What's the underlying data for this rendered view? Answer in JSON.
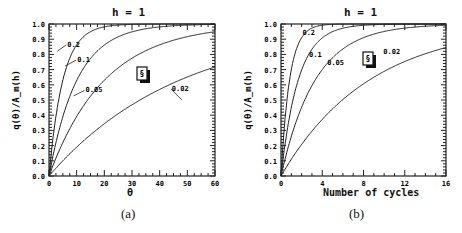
{
  "chart_data": [
    {
      "type": "line",
      "panel": "(a)",
      "title": "h = 1",
      "xlabel": "θ",
      "ylabel": "q(θ)/A_m(h)",
      "xlim": [
        0,
        60
      ],
      "ylim": [
        0.0,
        1.0
      ],
      "xticks": [
        "0",
        "10",
        "20",
        "30",
        "40",
        "50",
        "60"
      ],
      "yticks": [
        "0.0",
        "0.1",
        "0.2",
        "0.3",
        "0.4",
        "0.5",
        "0.6",
        "0.7",
        "0.8",
        "0.9",
        "1.0"
      ],
      "grid": false,
      "legend_icon": "stacked-page-icon",
      "x": [
        0,
        5,
        10,
        20,
        30,
        40,
        60
      ],
      "series": [
        {
          "name": "0.2",
          "values": [
            0,
            0.63,
            0.86,
            0.98,
            1.0,
            1.0,
            1.0
          ]
        },
        {
          "name": "0.1",
          "values": [
            0,
            0.39,
            0.63,
            0.86,
            0.95,
            0.98,
            1.0
          ]
        },
        {
          "name": "0.05",
          "values": [
            0,
            0.22,
            0.39,
            0.63,
            0.78,
            0.86,
            0.95
          ]
        },
        {
          "name": "0.02",
          "values": [
            0,
            0.1,
            0.18,
            0.33,
            0.45,
            0.55,
            0.7
          ]
        }
      ]
    },
    {
      "type": "line",
      "panel": "(b)",
      "title": "h = 1",
      "xlabel": "Number of cycles",
      "ylabel": "q(θ)/A_m(h)",
      "xlim": [
        0,
        16
      ],
      "ylim": [
        0.0,
        1.0
      ],
      "xticks": [
        "0",
        "4",
        "8",
        "12",
        "16"
      ],
      "yticks": [
        "0.0",
        "0.1",
        "0.2",
        "0.3",
        "0.4",
        "0.5",
        "0.6",
        "0.7",
        "0.8",
        "0.9",
        "1.0"
      ],
      "grid": false,
      "legend_icon": "stacked-page-icon",
      "x": [
        0,
        1,
        2,
        4,
        8,
        12,
        16
      ],
      "series": [
        {
          "name": "0.2",
          "values": [
            0,
            0.7,
            0.91,
            0.99,
            1.0,
            1.0,
            1.0
          ]
        },
        {
          "name": "0.1",
          "values": [
            0,
            0.45,
            0.7,
            0.91,
            0.99,
            1.0,
            1.0
          ]
        },
        {
          "name": "0.05",
          "values": [
            0,
            0.26,
            0.45,
            0.7,
            0.91,
            0.97,
            0.99
          ]
        },
        {
          "name": "0.02",
          "values": [
            0,
            0.11,
            0.21,
            0.38,
            0.62,
            0.76,
            0.85
          ]
        }
      ]
    }
  ],
  "captions": {
    "a": "(a)",
    "b": "(b)"
  },
  "titles": {
    "a": "h = 1",
    "b": "h = 1"
  },
  "xlabels": {
    "a": "θ",
    "b": "Number of cycles"
  },
  "ylabel": "q(θ)/A_m(h)"
}
